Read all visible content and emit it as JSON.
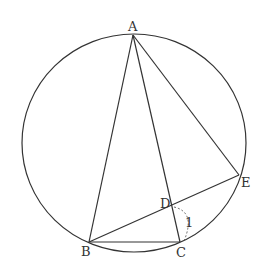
{
  "diagram": {
    "type": "geometry",
    "stroke_color": "#333333",
    "points": {
      "A": {
        "label": "A",
        "x": 133,
        "y": 35
      },
      "B": {
        "label": "B",
        "x": 89,
        "y": 242
      },
      "C": {
        "label": "C",
        "x": 180,
        "y": 242
      },
      "D": {
        "label": "D",
        "x": 172,
        "y": 206
      },
      "E": {
        "label": "E",
        "x": 239,
        "y": 175
      }
    },
    "circle": {
      "cx": 134,
      "cy": 143,
      "rx": 112,
      "ry": 109
    },
    "segments": [
      [
        "A",
        "B"
      ],
      [
        "A",
        "C"
      ],
      [
        "A",
        "E"
      ],
      [
        "B",
        "C"
      ],
      [
        "B",
        "E"
      ]
    ],
    "angle_mark": {
      "label": "1",
      "at": "D",
      "style": "dashed-arc"
    }
  }
}
